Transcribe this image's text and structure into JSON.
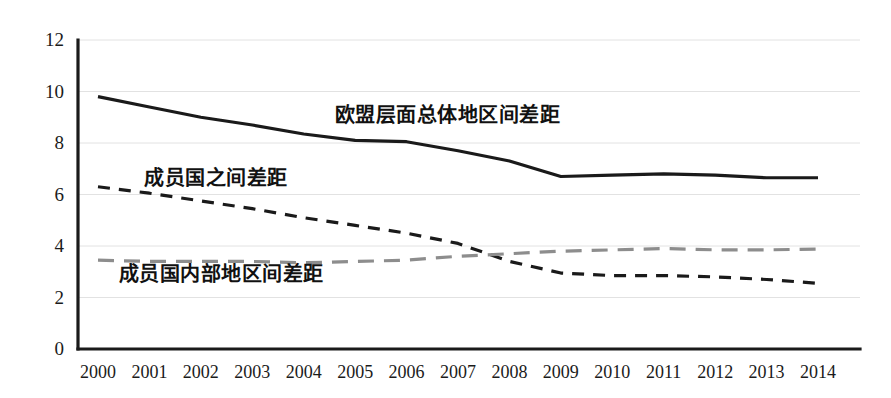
{
  "chart_data": {
    "type": "line",
    "title": "",
    "xlabel": "",
    "ylabel": "",
    "grid": true,
    "legend_position": "inline-annotations",
    "categories": [
      "2000",
      "2001",
      "2002",
      "2003",
      "2004",
      "2005",
      "2006",
      "2007",
      "2008",
      "2009",
      "2010",
      "2011",
      "2012",
      "2013",
      "2014"
    ],
    "x": [
      2000,
      2001,
      2002,
      2003,
      2004,
      2005,
      2006,
      2007,
      2008,
      2009,
      2010,
      2011,
      2012,
      2013,
      2014
    ],
    "xlim": [
      2000,
      2014
    ],
    "ylim": [
      0,
      12
    ],
    "yticks": [
      0,
      2,
      4,
      6,
      8,
      10,
      12
    ],
    "ytick_labels": [
      "0",
      "2",
      "4",
      "6",
      "8",
      "10",
      "12"
    ],
    "series": [
      {
        "name": "欧盟层面总体地区间差距",
        "style": "solid",
        "color": "#1a1a1a",
        "width": 3.2,
        "values": [
          9.8,
          9.4,
          9.0,
          8.7,
          8.35,
          8.1,
          8.05,
          7.7,
          7.3,
          6.7,
          6.75,
          6.8,
          6.75,
          6.65,
          6.65
        ]
      },
      {
        "name": "成员国之间差距",
        "style": "dashed",
        "color": "#1a1a1a",
        "width": 3.2,
        "values": [
          6.3,
          6.05,
          5.75,
          5.45,
          5.1,
          4.8,
          4.5,
          4.1,
          3.4,
          2.95,
          2.85,
          2.85,
          2.8,
          2.7,
          2.55
        ]
      },
      {
        "name": "成员国内部地区间差距",
        "style": "dashed",
        "color": "#8d8d8d",
        "width": 3.2,
        "values": [
          3.45,
          3.4,
          3.4,
          3.4,
          3.35,
          3.4,
          3.45,
          3.6,
          3.7,
          3.8,
          3.85,
          3.9,
          3.85,
          3.85,
          3.88
        ]
      }
    ],
    "annotations": [
      {
        "text": "欧盟层面总体地区间差距",
        "x": 2004.6,
        "y": 9.0
      },
      {
        "text": "成员国之间差距",
        "x": 2000.9,
        "y": 6.55
      },
      {
        "text": "成员国内部地区间差距",
        "x": 2000.4,
        "y": 2.85
      }
    ]
  },
  "axes": {
    "y_tick_labels": [
      "12",
      "10",
      "8",
      "6",
      "4",
      "2",
      "0"
    ],
    "x_tick_labels": [
      "2000",
      "2001",
      "2002",
      "2003",
      "2004",
      "2005",
      "2006",
      "2007",
      "2008",
      "2009",
      "2010",
      "2011",
      "2012",
      "2013",
      "2014"
    ]
  },
  "colors": {
    "series_solid": "#1a1a1a",
    "series_dashed_black": "#1a1a1a",
    "series_dashed_gray": "#8d8d8d",
    "gridline": "#e2e2e2",
    "axis": "#1a1a1a",
    "background": "#ffffff"
  }
}
